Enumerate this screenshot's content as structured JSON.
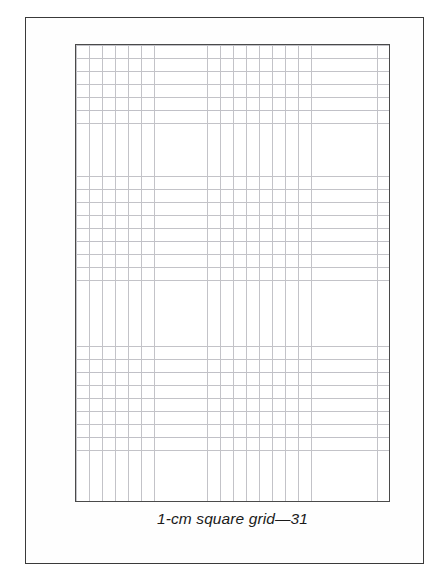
{
  "page": {
    "background_color": "#ffffff",
    "frame_color": "#3a3a3a"
  },
  "figure": {
    "caption": "1-cm square grid—31",
    "grid_border_color": "#4a4a4a",
    "grid_line_color": "#c3c3c8",
    "grid_fill_color": "#ffffff"
  },
  "chart_data": {
    "type": "table",
    "title": "1-cm square grid—31",
    "xlabel": "",
    "ylabel": "",
    "columns": 24,
    "rows": 35,
    "cell_size_label": "1 cm",
    "grid": true,
    "legend": "none",
    "categories": [],
    "values": []
  }
}
